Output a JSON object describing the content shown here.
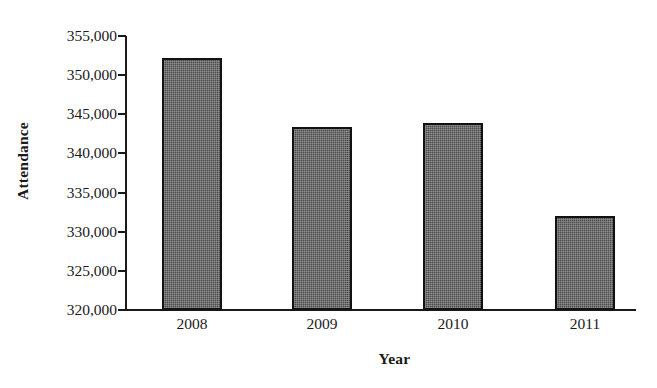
{
  "chart_data": {
    "type": "bar",
    "title": "",
    "xlabel": "Year",
    "ylabel": "Attendance",
    "categories": [
      "2008",
      "2009",
      "2010",
      "2011"
    ],
    "values": [
      352200,
      343400,
      343900,
      332000
    ],
    "series": [
      {
        "name": "Attendance",
        "values": [
          352200,
          343400,
          343900,
          332000
        ]
      }
    ],
    "ylim": [
      320000,
      355000
    ],
    "ytick_step": 5000,
    "ytick_labels": [
      "355,000",
      "350,000",
      "345,000",
      "340,000",
      "335,000",
      "330,000",
      "325,000",
      "320,000"
    ],
    "ytick_values": [
      355000,
      350000,
      345000,
      340000,
      335000,
      330000,
      325000,
      320000
    ],
    "grid": false,
    "legend": false,
    "legend_position": "none",
    "bar_color": "#4d4d4d",
    "bar_border_color": "#121212",
    "axis_color": "#1a1a1a",
    "background_color": "#ffffff"
  }
}
